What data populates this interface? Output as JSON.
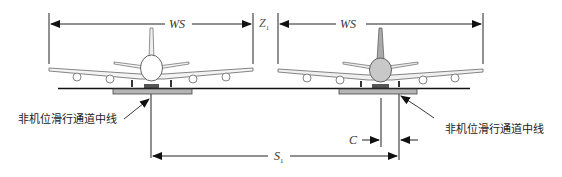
{
  "diagram": {
    "type": "aircraft taxiway separation schematic",
    "labels": {
      "left_wingspan": "WS",
      "right_wingspan": "WS",
      "wingtip_clearance": "Z",
      "wingtip_clearance_sub": "1",
      "centerline_separation": "S",
      "centerline_separation_sub": "1",
      "deviation": "C",
      "left_centerline_label": "非机位滑行通道中线",
      "right_centerline_label": "非机位滑行通道中线"
    },
    "colors": {
      "line": "#111111",
      "pavement": "#b5b5b5",
      "aircraft_left_fuselage": "#ffffff",
      "aircraft_right_fuselage": "#c8c8c8",
      "aircraft_outline": "#555555"
    }
  }
}
